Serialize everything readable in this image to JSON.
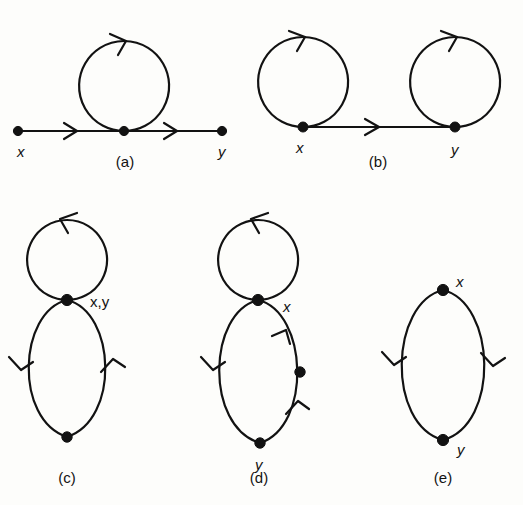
{
  "figure": {
    "width": 523,
    "height": 505,
    "background_color": "#fdfdfb",
    "ink_color": "#121212"
  },
  "panels": [
    {
      "id": "a",
      "caption": "(a)",
      "caption_x": 125,
      "caption_y": 167,
      "labels": [
        {
          "text": "x",
          "x": 17,
          "y": 157
        },
        {
          "text": "y",
          "x": 218,
          "y": 157
        }
      ],
      "vertices": [
        {
          "name": "x-vertex",
          "cx": 18,
          "cy": 131,
          "r": 4.6
        },
        {
          "name": "center-vertex",
          "cx": 124,
          "cy": 131,
          "r": 4.6
        },
        {
          "name": "y-vertex",
          "cx": 222,
          "cy": 131,
          "r": 4.6
        }
      ],
      "edges": [
        {
          "name": "left-segment",
          "d": "M 18 131 L 124 131"
        },
        {
          "name": "right-segment",
          "d": "M 124 131 L 222 131"
        },
        {
          "name": "tadpole-loop",
          "d": "M 124 131 A 45 45 0 1 1 124.2 131"
        }
      ],
      "arrows": [
        {
          "name": "left-segment-arrow",
          "d": "M 64 123 L 77 131 L 64 139"
        },
        {
          "name": "right-segment-arrow",
          "d": "M 164 123 L 177 131 L 164 139"
        },
        {
          "name": "loop-top-arrow",
          "d": "M 110 34 L 126 41 L 118 55"
        }
      ]
    },
    {
      "id": "b",
      "caption": "(b)",
      "caption_x": 378,
      "caption_y": 167,
      "labels": [
        {
          "text": "x",
          "x": 296,
          "y": 153
        },
        {
          "text": "y",
          "x": 451,
          "y": 155
        }
      ],
      "vertices": [
        {
          "name": "x-vertex",
          "cx": 303,
          "cy": 127,
          "r": 5.0
        },
        {
          "name": "y-vertex",
          "cx": 455,
          "cy": 127,
          "r": 5.0
        }
      ],
      "edges": [
        {
          "name": "left-loop",
          "d": "M 303 127 A 45 45 0 1 1 303.2 127"
        },
        {
          "name": "connecting-line",
          "d": "M 303 127 L 455 127"
        },
        {
          "name": "right-loop",
          "d": "M 455 127 A 45 45 0 1 1 455.2 127"
        }
      ],
      "arrows": [
        {
          "name": "left-loop-arrow",
          "d": "M 289 31 L 305 37 L 297 51"
        },
        {
          "name": "connecting-line-arrow",
          "d": "M 365 119 L 379 127 L 365 135"
        },
        {
          "name": "right-loop-arrow",
          "d": "M 441 31 L 457 37 L 449 51"
        }
      ]
    },
    {
      "id": "c",
      "caption": "(c)",
      "caption_x": 67,
      "caption_y": 483,
      "labels": [
        {
          "text": "x,y",
          "x": 90,
          "y": 307,
          "upright": true
        }
      ],
      "vertices": [
        {
          "name": "junction-vertex",
          "cx": 67,
          "cy": 300,
          "r": 5.6
        },
        {
          "name": "bottom-vertex",
          "cx": 67,
          "cy": 437,
          "r": 5.2
        }
      ],
      "edges": [
        {
          "name": "upper-loop",
          "d": "M 67 300 A 40 40 0 1 1 67.2 300"
        },
        {
          "name": "lower-loop-left",
          "d": "M 67 300 C 18 312, 14 420, 67 437"
        },
        {
          "name": "lower-loop-right",
          "d": "M 67 300 C 116 312, 120 420, 67 437"
        }
      ],
      "arrows": [
        {
          "name": "upper-loop-arrow",
          "d": "M 77 213 L 60 219 L 68 233"
        },
        {
          "name": "lower-left-arrow",
          "d": "M 9 357 L 21 370 L 33 362"
        },
        {
          "name": "lower-right-arrow",
          "d": "M 101 372 L 113 359 L 125 367"
        }
      ]
    },
    {
      "id": "d",
      "caption": "(d)",
      "caption_x": 259,
      "caption_y": 483,
      "labels": [
        {
          "text": "x",
          "x": 283,
          "y": 312
        },
        {
          "text": "y",
          "x": 255,
          "y": 470
        }
      ],
      "vertices": [
        {
          "name": "junction-vertex-x",
          "cx": 258,
          "cy": 300,
          "r": 5.6
        },
        {
          "name": "right-arc-dot",
          "cx": 300,
          "cy": 372,
          "r": 5.2
        },
        {
          "name": "bottom-vertex-y",
          "cx": 260,
          "cy": 443,
          "r": 5.2
        }
      ],
      "edges": [
        {
          "name": "upper-loop",
          "d": "M 258 300 A 40 40 0 1 1 258.2 300"
        },
        {
          "name": "lower-loop-left",
          "d": "M 258 300 C 208 312, 204 426, 260 443"
        },
        {
          "name": "lower-loop-right",
          "d": "M 258 300 C 308 312, 312 426, 260 443"
        }
      ],
      "arrows": [
        {
          "name": "upper-loop-arrow",
          "d": "M 268 213 L 251 219 L 259 233"
        },
        {
          "name": "lower-left-arrow",
          "d": "M 201 357 L 213 370 L 225 362"
        },
        {
          "name": "upper-right-arrow",
          "d": "M 272 336 L 286 330 L 290 344"
        },
        {
          "name": "lower-right-arrow",
          "d": "M 286 414 L 298 401 L 309 409"
        }
      ]
    },
    {
      "id": "e",
      "caption": "(e)",
      "caption_x": 443,
      "caption_y": 483,
      "labels": [
        {
          "text": "x",
          "x": 456,
          "y": 287
        },
        {
          "text": "y",
          "x": 457,
          "y": 455
        }
      ],
      "vertices": [
        {
          "name": "top-vertex-x",
          "cx": 443,
          "cy": 290,
          "r": 5.6
        },
        {
          "name": "bottom-vertex-y",
          "cx": 443,
          "cy": 440,
          "r": 5.6
        }
      ],
      "edges": [
        {
          "name": "left-arc",
          "d": "M 443 290 C 390 303, 386 424, 443 440"
        },
        {
          "name": "right-arc",
          "d": "M 443 290 C 496 303, 500 424, 443 440"
        }
      ],
      "arrows": [
        {
          "name": "left-arc-arrow",
          "d": "M 382 352 L 394 365 L 406 357"
        },
        {
          "name": "right-arc-arrow",
          "d": "M 481 353 L 493 366 L 505 358"
        }
      ]
    }
  ]
}
